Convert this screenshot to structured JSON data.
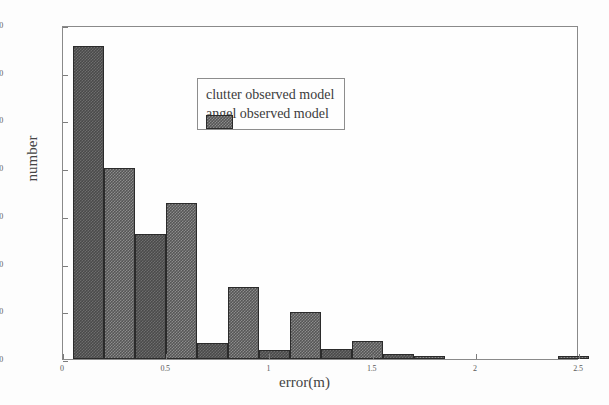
{
  "chart_data": {
    "type": "bar",
    "title": "",
    "xlabel": "error(m)",
    "ylabel": "number",
    "xlim": [
      0,
      2.5
    ],
    "ylim": [
      0,
      350
    ],
    "grid": false,
    "legend_position": "upper-center",
    "xticks": [
      "0",
      "0.5",
      "1",
      "1.5",
      "2",
      "2.5"
    ],
    "xtick_values": [
      0,
      0.5,
      1,
      1.5,
      2,
      2.5
    ],
    "yticks": [
      "0",
      "50",
      "100",
      "150",
      "200",
      "250",
      "300",
      "350"
    ],
    "ytick_values": [
      0,
      50,
      100,
      150,
      200,
      250,
      300,
      350
    ],
    "x": [
      0.05,
      0.35,
      0.65,
      0.95,
      1.25,
      1.55,
      2.25
    ],
    "series": [
      {
        "name": "clutter observed model",
        "color": "#4a4a4a",
        "values": [
          328,
          131,
          17,
          9,
          10,
          5,
          0
        ]
      },
      {
        "name": "angel observed model",
        "color": "#565656",
        "values": [
          200,
          164,
          75,
          49,
          19,
          3,
          3
        ]
      }
    ]
  },
  "legend": {
    "items": [
      {
        "label": "clutter observed model",
        "swatch": "clutter"
      },
      {
        "label": "angel observed model",
        "swatch": "angel"
      }
    ]
  }
}
